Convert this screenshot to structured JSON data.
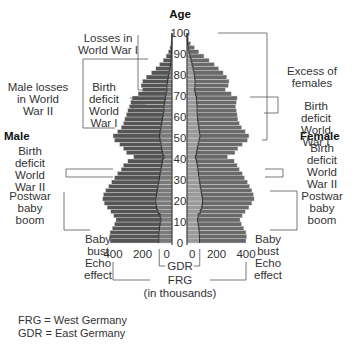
{
  "chart_data": {
    "type": "bar",
    "subtype": "population-pyramid",
    "title": "Age",
    "ylabel": "Age",
    "xlabel": "FRG (in thousands)",
    "xlabel_line2": "(in thousands)",
    "gdr_label": "GDR",
    "frg_label": "FRG",
    "ylim": [
      0,
      100
    ],
    "xlim_each_side": [
      0,
      450
    ],
    "age_ticks": [
      0,
      10,
      20,
      30,
      40,
      50,
      60,
      70,
      80,
      90,
      100
    ],
    "x_ticks_left": [
      "400",
      "200",
      "0"
    ],
    "x_ticks_right": [
      "0",
      "200",
      "400"
    ],
    "sides": {
      "left": "Male",
      "right": "Female"
    },
    "ages": [
      0,
      2,
      4,
      6,
      8,
      10,
      12,
      14,
      16,
      18,
      20,
      22,
      24,
      26,
      28,
      30,
      32,
      34,
      36,
      38,
      40,
      42,
      44,
      46,
      48,
      50,
      52,
      54,
      56,
      58,
      60,
      62,
      64,
      66,
      68,
      70,
      72,
      74,
      76,
      78,
      80,
      82,
      84,
      86,
      88,
      90,
      92,
      94,
      96,
      98
    ],
    "series": [
      {
        "name": "FRG Male (total)",
        "values": [
          420,
          425,
          420,
          405,
          390,
          380,
          395,
          415,
          440,
          460,
          470,
          465,
          450,
          430,
          410,
          390,
          370,
          345,
          330,
          300,
          260,
          310,
          330,
          355,
          390,
          400,
          370,
          345,
          330,
          320,
          310,
          300,
          290,
          280,
          270,
          230,
          200,
          210,
          200,
          175,
          140,
          110,
          85,
          60,
          40,
          25,
          14,
          8,
          4,
          2
        ]
      },
      {
        "name": "GDR Male",
        "values": [
          90,
          90,
          88,
          85,
          80,
          75,
          80,
          95,
          105,
          110,
          110,
          105,
          100,
          95,
          90,
          85,
          80,
          75,
          70,
          65,
          55,
          65,
          70,
          75,
          80,
          85,
          80,
          75,
          70,
          65,
          60,
          55,
          55,
          50,
          45,
          40,
          35,
          35,
          30,
          25,
          20,
          15,
          10,
          8,
          5,
          3,
          2,
          1,
          1,
          0
        ]
      },
      {
        "name": "FRG Female (total)",
        "values": [
          400,
          405,
          400,
          385,
          370,
          360,
          375,
          395,
          420,
          440,
          455,
          450,
          440,
          425,
          410,
          390,
          375,
          355,
          340,
          320,
          275,
          325,
          345,
          375,
          410,
          420,
          395,
          370,
          355,
          345,
          340,
          335,
          330,
          335,
          340,
          300,
          260,
          280,
          285,
          270,
          245,
          215,
          185,
          150,
          115,
          80,
          50,
          25,
          12,
          5
        ]
      },
      {
        "name": "GDR Female",
        "values": [
          85,
          85,
          83,
          80,
          76,
          72,
          76,
          90,
          100,
          105,
          105,
          100,
          95,
          90,
          86,
          82,
          78,
          74,
          70,
          65,
          57,
          65,
          70,
          76,
          82,
          88,
          84,
          80,
          76,
          72,
          70,
          68,
          68,
          66,
          64,
          58,
          52,
          54,
          55,
          52,
          48,
          42,
          35,
          28,
          20,
          14,
          8,
          4,
          2,
          1
        ]
      }
    ],
    "annotations_left": [
      {
        "text": [
          "Losses in",
          "World War I"
        ],
        "age_range": [
          88,
          100
        ]
      },
      {
        "text": [
          "Male losses",
          "in World",
          "War II"
        ],
        "age_range": [
          58,
          90
        ]
      },
      {
        "text": [
          "Birth",
          "deficit",
          "World",
          "War I"
        ],
        "age_range": [
          68,
          72
        ]
      },
      {
        "text": [
          "Birth",
          "deficit",
          "World",
          "War II"
        ],
        "age_range": [
          38,
          44
        ]
      },
      {
        "text": [
          "Postwar",
          "baby",
          "boom"
        ],
        "age_range": [
          15,
          35
        ]
      },
      {
        "text": [
          "Baby",
          "bust",
          "Echo",
          "effect"
        ],
        "age_range": [
          0,
          15
        ]
      }
    ],
    "annotations_right": [
      {
        "text": [
          "Excess of",
          "females"
        ],
        "age_range": [
          60,
          100
        ]
      },
      {
        "text": [
          "Birth",
          "deficit",
          "World",
          "War I"
        ],
        "age_range": [
          68,
          72
        ]
      },
      {
        "text": [
          "Birth",
          "deficit",
          "World",
          "War II"
        ],
        "age_range": [
          38,
          44
        ]
      },
      {
        "text": [
          "Postwar",
          "baby",
          "boom"
        ],
        "age_range": [
          15,
          35
        ]
      },
      {
        "text": [
          "Baby",
          "bust",
          "Echo",
          "effect"
        ],
        "age_range": [
          0,
          15
        ]
      }
    ]
  },
  "legend": {
    "frg": "FRG = West Germany",
    "gdr": "GDR = East Germany"
  },
  "colors": {
    "frg_male": "#555555",
    "gdr_male": "#7a7a7a",
    "frg_female": "#6a6a6a",
    "gdr_female": "#9a9a9a",
    "bar_line": "#dddddd",
    "lines": "#555555"
  }
}
